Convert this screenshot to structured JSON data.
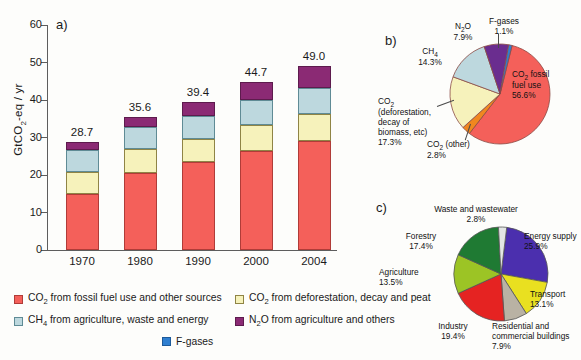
{
  "figure": {
    "panel_a_label": "a)",
    "panel_b_label": "b)",
    "panel_c_label": "c)"
  },
  "chart_data": [
    {
      "type": "bar",
      "panel": "a",
      "title": "",
      "xlabel": "",
      "ylabel": "GtCO2-eq / yr",
      "ylim": [
        0,
        60
      ],
      "yticks": [
        0,
        10,
        20,
        30,
        40,
        50,
        60
      ],
      "grid": false,
      "stacked": true,
      "categories": [
        "1970",
        "1980",
        "1990",
        "2000",
        "2004"
      ],
      "totals": [
        "28.7",
        "35.6",
        "39.4",
        "44.7",
        "49.0"
      ],
      "series": [
        {
          "name": "CO2 from fossil fuel use and other sources",
          "color": "#f4605a",
          "values": [
            15.0,
            20.5,
            23.4,
            26.3,
            29.0
          ]
        },
        {
          "name": "CO2 from deforestation, decay and peat",
          "color": "#f6f2bb",
          "values": [
            5.9,
            6.4,
            6.2,
            7.1,
            7.3
          ]
        },
        {
          "name": "CH4 from agriculture, waste and energy",
          "color": "#bdd8de",
          "values": [
            5.8,
            5.8,
            6.2,
            6.6,
            7.0
          ]
        },
        {
          "name": "N2O from agriculture and others",
          "color": "#8b2a74",
          "values": [
            2.0,
            2.9,
            3.6,
            4.7,
            5.7
          ]
        }
      ],
      "legend_position": "bottom",
      "legend": [
        {
          "label_html": "CO2 from fossil fuel use and other sources",
          "color": "#f4605a"
        },
        {
          "label_html": "CO2 from deforestation, decay and peat",
          "color": "#f6f2bb"
        },
        {
          "label_html": "CH4 from agriculture, waste and energy",
          "color": "#bdd8de"
        },
        {
          "label_html": "N2O from agriculture and others",
          "color": "#8b2a74"
        },
        {
          "label_html": "F-gases",
          "color": "#2f7fd0"
        }
      ]
    },
    {
      "type": "pie",
      "panel": "b",
      "title": "",
      "slices": [
        {
          "label": "CO2 fossil fuel use",
          "value": 56.6,
          "pct": "56.6%",
          "color": "#f4605a"
        },
        {
          "label": "CO2 (other)",
          "value": 2.8,
          "pct": "2.8%",
          "color": "#f0871f"
        },
        {
          "label": "CO2 (deforestation, decay of biomass, etc)",
          "value": 17.3,
          "pct": "17.3%",
          "color": "#f6f2bb"
        },
        {
          "label": "CH4",
          "value": 14.3,
          "pct": "14.3%",
          "color": "#bdd8de"
        },
        {
          "label": "N2O",
          "value": 7.9,
          "pct": "7.9%",
          "color": "#6a2d8f"
        },
        {
          "label": "F-gases",
          "value": 1.1,
          "pct": "1.1%",
          "color": "#2f7fd0"
        }
      ]
    },
    {
      "type": "pie",
      "panel": "c",
      "title": "",
      "slices": [
        {
          "label": "Energy supply",
          "value": 25.9,
          "pct": "25.9%",
          "color": "#4b2fae"
        },
        {
          "label": "Transport",
          "value": 13.1,
          "pct": "13.1%",
          "color": "#e9e020"
        },
        {
          "label": "Residential and commercial buildings",
          "value": 7.9,
          "pct": "7.9%",
          "color": "#b9b2a4"
        },
        {
          "label": "Industry",
          "value": 19.4,
          "pct": "19.4%",
          "color": "#e52322"
        },
        {
          "label": "Agriculture",
          "value": 13.5,
          "pct": "13.5%",
          "color": "#9cc425"
        },
        {
          "label": "Forestry",
          "value": 17.4,
          "pct": "17.4%",
          "color": "#1f7a33"
        },
        {
          "label": "Waste and wastewater",
          "value": 2.8,
          "pct": "2.8%",
          "color": "#e3e6e4"
        }
      ]
    }
  ],
  "axis": {
    "y_title_pre": "GtCO",
    "y_title_sub": "2",
    "y_title_post": "-eq / yr"
  },
  "legend_rich": {
    "fossil": {
      "pre": "CO",
      "sub": "2",
      "post": " from fossil fuel use and other sources"
    },
    "defor": {
      "pre": "CO",
      "sub": "2",
      "post": " from deforestation, decay and peat"
    },
    "ch4": {
      "pre": "CH",
      "sub": "4",
      "post": " from agriculture, waste and energy"
    },
    "n2o": {
      "pre": "N",
      "sub": "2",
      "post": "O from agriculture and others"
    },
    "fgases": {
      "pre": "F-gases",
      "sub": "",
      "post": ""
    }
  },
  "pie_b_labels": {
    "fossil": {
      "l1": "CO",
      "sub": "2",
      "l1b": " fossil",
      "l2": "fuel use",
      "l3": "56.6%"
    },
    "other": {
      "l1": "CO",
      "sub": "2",
      "l1b": " (other)",
      "l2": "2.8%"
    },
    "defor": {
      "l1": "CO",
      "sub": "2",
      "l2": "(deforestation,",
      "l3": "decay of",
      "l4": "biomass, etc)",
      "l5": "17.3%"
    },
    "ch4": {
      "l1": "CH",
      "sub": "4",
      "l2": "14.3%"
    },
    "n2o": {
      "l1": "N",
      "sub": "2",
      "l1b": "O",
      "l2": "7.9%"
    },
    "fgases": {
      "l1": "F-gases",
      "l2": "1.1%"
    }
  },
  "pie_c_labels": {
    "waste": {
      "l1": "Waste and wastewater",
      "l2": "2.8%"
    },
    "energy": {
      "l1": "Energy supply",
      "l2": "25.9%"
    },
    "transport": {
      "l1": "Transport",
      "l2": "13.1%"
    },
    "residential": {
      "l1": "Residential and",
      "l2": "commercial buildings",
      "l3": "7.9%"
    },
    "industry": {
      "l1": "Industry",
      "l2": "19.4%"
    },
    "agriculture": {
      "l1": "Agriculture",
      "l2": "13.5%"
    },
    "forestry": {
      "l1": "Forestry",
      "l2": "17.4%"
    }
  }
}
